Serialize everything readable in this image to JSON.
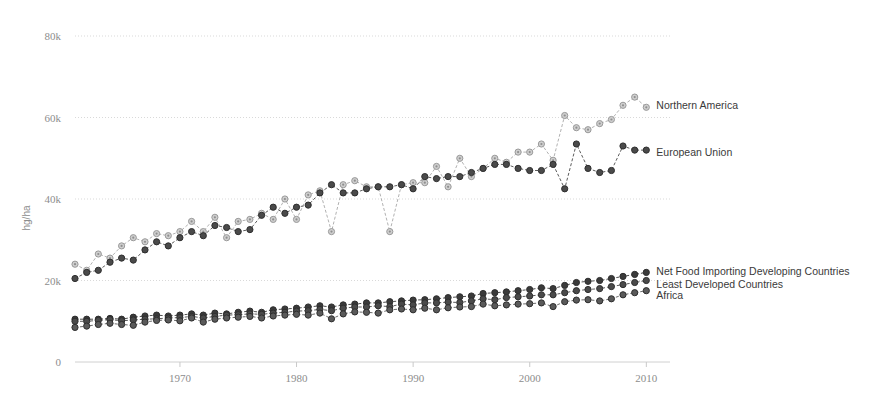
{
  "chart_data": {
    "type": "line",
    "title": "",
    "subtitle": "",
    "xlabel": "",
    "ylabel": "hg/ha",
    "xlim": [
      1961,
      2011
    ],
    "ylim": [
      0,
      80000
    ],
    "xticks": [
      1970,
      1980,
      1990,
      2000,
      2010
    ],
    "xtick_labels": [
      "1970",
      "1980",
      "1990",
      "2000",
      "2010"
    ],
    "yticks": [
      0,
      20000,
      40000,
      60000,
      80000
    ],
    "ytick_labels": [
      "0",
      "20k",
      "40k",
      "60k",
      "80k"
    ],
    "grid": true,
    "legend_position": "right-inline-end-of-line",
    "x": [
      1961,
      1962,
      1963,
      1964,
      1965,
      1966,
      1967,
      1968,
      1969,
      1970,
      1971,
      1972,
      1973,
      1974,
      1975,
      1976,
      1977,
      1978,
      1979,
      1980,
      1981,
      1982,
      1983,
      1984,
      1985,
      1986,
      1987,
      1988,
      1989,
      1990,
      1991,
      1992,
      1993,
      1994,
      1995,
      1996,
      1997,
      1998,
      1999,
      2000,
      2001,
      2002,
      2003,
      2004,
      2005,
      2006,
      2007,
      2008,
      2009,
      2010
    ],
    "series": [
      {
        "name": "Northern America",
        "color": "#a8a8a8",
        "marker": "circle-light",
        "label_color": "#3a3a3a",
        "values": [
          24000,
          22500,
          26500,
          25500,
          28500,
          30500,
          29500,
          31500,
          31000,
          32000,
          34500,
          32000,
          35500,
          30500,
          34500,
          35000,
          36500,
          35000,
          40000,
          35000,
          41000,
          42000,
          32000,
          43500,
          44500,
          43000,
          43000,
          32000,
          43500,
          44000,
          44000,
          48000,
          43000,
          50000,
          45500,
          47500,
          50000,
          49000,
          51500,
          51500,
          53500,
          49500,
          60500,
          57500,
          57000,
          58500,
          59500,
          63000,
          65000,
          62500
        ]
      },
      {
        "name": "European Union",
        "color": "#4a4a4a",
        "marker": "circle-dark",
        "label_color": "#3a3a3a",
        "values": [
          20500,
          22000,
          22500,
          24500,
          25500,
          25000,
          27500,
          29500,
          28500,
          30500,
          32000,
          31000,
          33500,
          33000,
          32000,
          32500,
          36000,
          38000,
          36500,
          38000,
          38500,
          41500,
          43500,
          41500,
          41500,
          42500,
          43000,
          43000,
          43500,
          42500,
          45500,
          45000,
          45500,
          45500,
          46500,
          47500,
          48500,
          48500,
          47500,
          47000,
          47000,
          48500,
          42500,
          53500,
          47500,
          46500,
          47000,
          53000,
          52000,
          52000
        ]
      },
      {
        "name": "Net Food Importing Developing Countries",
        "color": "#3a3a3a",
        "marker": "circle-dark",
        "label_color": "#3a3a3a",
        "values": [
          10500,
          10500,
          10500,
          10700,
          10500,
          11000,
          11300,
          11500,
          11300,
          11500,
          11800,
          11500,
          12000,
          11800,
          12200,
          12500,
          12200,
          12800,
          13000,
          13200,
          13500,
          13800,
          13500,
          14000,
          14200,
          14500,
          14500,
          14800,
          15000,
          15200,
          15300,
          15500,
          15800,
          16000,
          16200,
          16800,
          17000,
          17200,
          17500,
          17800,
          18200,
          18000,
          18800,
          19500,
          19800,
          20000,
          20500,
          21000,
          21500,
          22000
        ]
      },
      {
        "name": "Least Developed Countries",
        "color": "#4a4a4a",
        "marker": "circle-dark",
        "label_color": "#3a3a3a",
        "values": [
          10000,
          10000,
          10200,
          10400,
          10100,
          10300,
          10500,
          10600,
          10800,
          10900,
          11200,
          10800,
          11200,
          11500,
          11600,
          11800,
          11700,
          12000,
          12200,
          12500,
          12600,
          12900,
          12600,
          13200,
          13500,
          13500,
          13800,
          13600,
          14200,
          14000,
          14500,
          14500,
          14700,
          14600,
          15000,
          15500,
          15300,
          15800,
          16000,
          16200,
          16500,
          16500,
          17000,
          17500,
          17800,
          18000,
          18500,
          19000,
          19500,
          20000
        ]
      },
      {
        "name": "Africa",
        "color": "#5a5a5a",
        "marker": "circle-dark",
        "label_color": "#3a3a3a",
        "values": [
          8500,
          8800,
          9200,
          9500,
          9200,
          9000,
          9800,
          10200,
          10300,
          10100,
          10800,
          9800,
          10500,
          10800,
          11000,
          11200,
          10800,
          11300,
          11500,
          11700,
          11500,
          12000,
          10600,
          11800,
          12300,
          12200,
          12000,
          12800,
          13000,
          12800,
          13200,
          12800,
          13300,
          13500,
          13600,
          14200,
          13800,
          14000,
          14200,
          14300,
          14500,
          13600,
          14800,
          15200,
          15300,
          15000,
          15500,
          16500,
          17000,
          17500
        ]
      }
    ]
  },
  "labels": {
    "northern_america": "Northern America",
    "european_union": "European Union",
    "net_food": "Net Food Importing Developing Countries",
    "least_developed": "Least Developed Countries",
    "africa": "Africa",
    "y_axis_title": "hg/ha"
  }
}
